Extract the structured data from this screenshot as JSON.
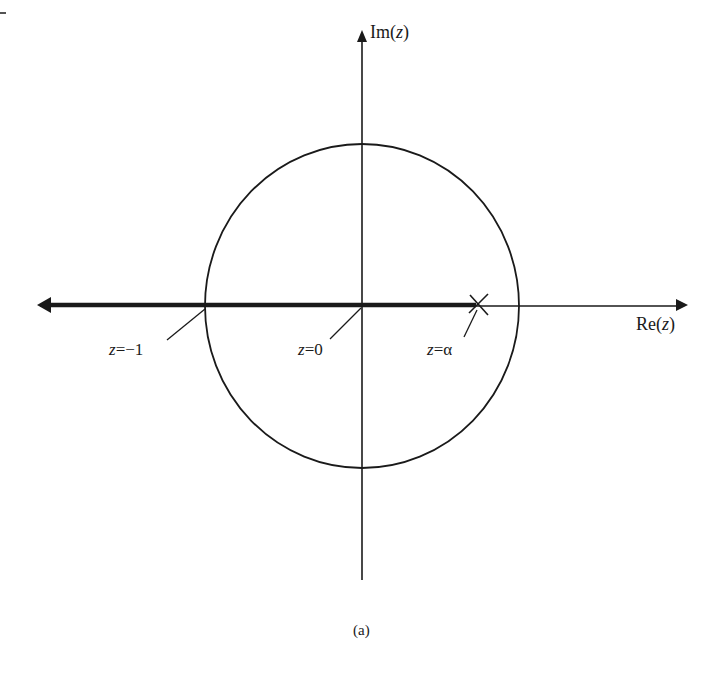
{
  "diagram": {
    "type": "complex-plane root locus",
    "axes": {
      "imaginary_label_prefix": "Im(",
      "imaginary_label_var": "z",
      "imaginary_label_suffix": ")",
      "real_label_prefix": "Re(",
      "real_label_var": "z",
      "real_label_suffix": ")"
    },
    "unit_circle": {
      "center_px": [
        362,
        306
      ],
      "rx_px": 157,
      "ry_px": 162
    },
    "locus": {
      "description": "thick line on real axis from left arrow to z=α",
      "from_x_px": 38,
      "to_x_px": 478
    },
    "pole": {
      "marker": "×",
      "x_px": 478,
      "y_px": 304
    },
    "annotations": [
      {
        "var": "z",
        "text": "=−1"
      },
      {
        "var": "z",
        "text": "=0"
      },
      {
        "var": "z",
        "text": "=α"
      }
    ],
    "caption": "(a)"
  },
  "colors": {
    "ink": "#1a1a1a",
    "background": "#ffffff"
  }
}
